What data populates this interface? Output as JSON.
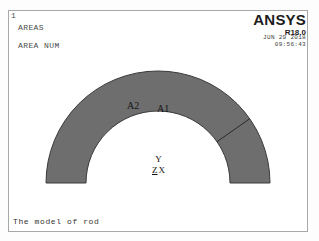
{
  "window": {
    "number": "1"
  },
  "header": {
    "lines": [
      {
        "label": "AREAS"
      },
      {
        "label": "AREA NUM"
      }
    ]
  },
  "logo": {
    "name": "ANSYS",
    "revision": "R18.0",
    "date": "JUN 29 2018",
    "time": "09:56:43"
  },
  "geometry": {
    "fill_color": "#6e6e6e",
    "edge_color": "#3a3a3a",
    "center_x": 150,
    "center_y": 173,
    "outer_radius": 112,
    "inner_radius": 72,
    "divider_angle_deg": 35
  },
  "labels": {
    "area_2": "A2",
    "area_1": "A1"
  },
  "triad": {
    "y_axis": "Y",
    "z_axis": "Z",
    "x_axis": "X"
  },
  "caption": {
    "text": "The model of rod"
  }
}
